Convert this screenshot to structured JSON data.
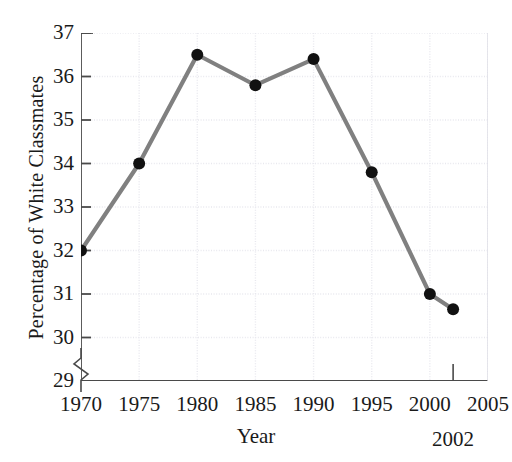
{
  "chart_data": {
    "type": "line",
    "title": "",
    "xlabel": "Year",
    "ylabel": "Percentage of White Classmates",
    "x": [
      1970,
      1975,
      1980,
      1985,
      1990,
      1995,
      2000,
      2002
    ],
    "values": [
      32.0,
      34.0,
      36.5,
      35.8,
      36.4,
      33.8,
      31.0,
      30.65
    ],
    "series": [
      {
        "name": "Percentage of White Classmates",
        "values": [
          32.0,
          34.0,
          36.5,
          35.8,
          36.4,
          33.8,
          31.0,
          30.65
        ]
      }
    ],
    "xlim": [
      1970,
      2005
    ],
    "ylim": [
      29,
      37
    ],
    "xticks": [
      1970,
      1975,
      1980,
      1985,
      1990,
      1995,
      2000,
      2005
    ],
    "yticks": [
      29,
      30,
      31,
      32,
      33,
      34,
      35,
      36,
      37
    ],
    "xtick_labels": [
      "1970",
      "1975",
      "1980",
      "1985",
      "1990",
      "1995",
      "2000",
      "2005"
    ],
    "ytick_labels": [
      "29",
      "30",
      "31",
      "32",
      "33",
      "34",
      "35",
      "36",
      "37"
    ],
    "grid": true,
    "legend": "none",
    "y_axis_break": true,
    "annotations": [
      {
        "label": "2002",
        "x": 2002,
        "type": "x-marker-line"
      }
    ],
    "line_color": "#808080",
    "marker_color": "#111111",
    "marker_shape": "circle",
    "grid_color": "#e8e8ee",
    "axis_color": "#4a4a4a"
  },
  "axis": {
    "y_title": "Percentage of White Classmates",
    "x_title": "Year"
  },
  "annotation": {
    "year_2002": "2002"
  },
  "page": {
    "top_cut_text": ""
  }
}
